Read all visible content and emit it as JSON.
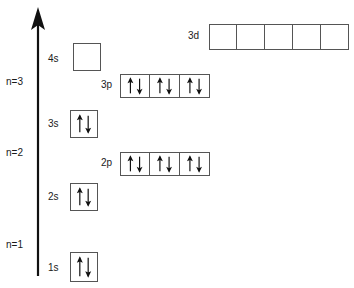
{
  "diagram": {
    "axis": {
      "name": "energy-axis",
      "direction": "up",
      "x": 38,
      "y_top": 8,
      "y_bottom": 276
    },
    "shell_labels": [
      {
        "text": "n=3",
        "x": 6,
        "y": 82
      },
      {
        "text": "n=2",
        "x": 6,
        "y": 153
      },
      {
        "text": "n=1",
        "x": 6,
        "y": 245
      }
    ],
    "subshells": [
      {
        "id": "3d",
        "label": "3d",
        "label_x": 188,
        "label_y": 35,
        "box_x": 209,
        "box_y": 24,
        "box_w": 28,
        "box_h": 26,
        "boxes": [
          "",
          "",
          "",
          "",
          ""
        ]
      },
      {
        "id": "4s",
        "label": "4s",
        "label_x": 48,
        "label_y": 58,
        "box_x": 73,
        "box_y": 43,
        "box_w": 28,
        "box_h": 28,
        "boxes": [
          ""
        ]
      },
      {
        "id": "3p",
        "label": "3p",
        "label_x": 101,
        "label_y": 84,
        "box_x": 120,
        "box_y": 74,
        "box_w": 30,
        "box_h": 24,
        "boxes": [
          "updown",
          "updown",
          "updown"
        ]
      },
      {
        "id": "3s",
        "label": "3s",
        "label_x": 48,
        "label_y": 123,
        "box_x": 70,
        "box_y": 110,
        "box_w": 28,
        "box_h": 28,
        "boxes": [
          "updown"
        ]
      },
      {
        "id": "2p",
        "label": "2p",
        "label_x": 101,
        "label_y": 162,
        "box_x": 120,
        "box_y": 152,
        "box_w": 30,
        "box_h": 24,
        "boxes": [
          "updown",
          "updown",
          "updown"
        ]
      },
      {
        "id": "2s",
        "label": "2s",
        "label_x": 48,
        "label_y": 196,
        "box_x": 70,
        "box_y": 183,
        "box_w": 28,
        "box_h": 28,
        "boxes": [
          "updown"
        ]
      },
      {
        "id": "1s",
        "label": "1s",
        "label_x": 48,
        "label_y": 268,
        "box_x": 70,
        "box_y": 252,
        "box_w": 28,
        "box_h": 30,
        "boxes": [
          "updown"
        ]
      }
    ],
    "colors": {
      "ink": "#1a1a1a",
      "box_border": "#555555",
      "arrow": "#111111",
      "background": "#ffffff"
    }
  }
}
